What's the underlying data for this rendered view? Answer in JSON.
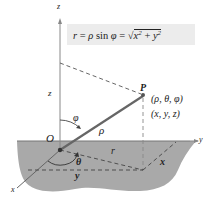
{
  "formula": {
    "lhs": "r",
    "eq1": " = ",
    "rho": "ρ",
    "sin": " sin ",
    "phi": "φ",
    "eq2": " = ",
    "radical": "√",
    "x": "x",
    "exp_x": "2",
    "plus": " + ",
    "y": "y",
    "exp_y": "2"
  },
  "labels": {
    "z_axis": "z",
    "y_axis": "y",
    "x_axis": "x",
    "z_height": "z",
    "origin": "O",
    "point": "P",
    "spherical_coords": "(ρ, θ, φ)",
    "rect_coords": "(x, y, z)",
    "phi_angle": "φ",
    "rho_length": "ρ",
    "r_length": "r",
    "theta_angle": "θ",
    "x_length": "x",
    "y_length": "y"
  },
  "colors": {
    "plane_fill": "#a9a9a9",
    "formula_bg": "#ececec",
    "line": "#444444",
    "dashed": "#555555",
    "rho_segment": "#666666"
  }
}
